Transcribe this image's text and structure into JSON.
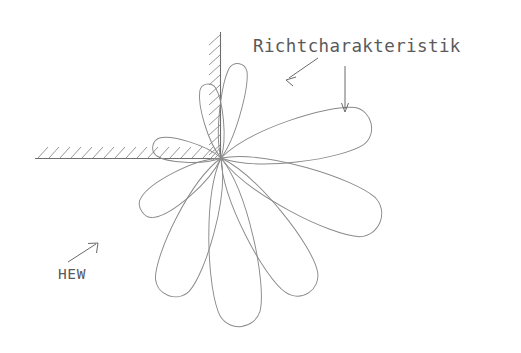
{
  "diagram": {
    "title_label": "Richtcharakteristik",
    "source_label": "HEW",
    "colors": {
      "lobe_stroke": "#8a8a8a",
      "wall_stroke": "#6e6e6e",
      "hatch_stroke": "#8a8a8a",
      "text": "#5a5a5a",
      "arrow": "#6a6a6a",
      "background": "#ffffff"
    },
    "origin": {
      "x": 221,
      "y": 158
    },
    "wall": {
      "name": "hatched-corner-wall",
      "horizontal": {
        "x1": 35,
        "y1": 158,
        "x2": 221,
        "y2": 158,
        "hatch_count": 17
      },
      "vertical": {
        "x1": 221,
        "y1": 32,
        "x2": 221,
        "y2": 158,
        "hatch_count": 12
      }
    },
    "annotations": [
      {
        "name": "arrow-to-upper-lobe",
        "type": "diagonal-arrow",
        "x1": 318,
        "y1": 58,
        "x2": 286,
        "y2": 80
      },
      {
        "name": "arrow-to-main-lobe",
        "type": "vertical-arrow",
        "x1": 345,
        "y1": 66,
        "x2": 345,
        "y2": 112
      },
      {
        "name": "hew-direction-arrow",
        "type": "diagonal-arrow",
        "x1": 68,
        "y1": 262,
        "x2": 98,
        "y2": 243
      }
    ],
    "lobes": [
      {
        "name": "lobe-up-near-vertical",
        "angle_deg": 101,
        "length": 74,
        "width": 17
      },
      {
        "name": "lobe-up-right-steep",
        "angle_deg": 79,
        "length": 97,
        "width": 19
      },
      {
        "name": "lobe-main-right",
        "angle_deg": 13,
        "length": 158,
        "width": 38
      },
      {
        "name": "lobe-lower-right-big",
        "angle_deg": -22,
        "length": 177,
        "width": 42
      },
      {
        "name": "lobe-lower-right-mid",
        "angle_deg": -57,
        "length": 166,
        "width": 38
      },
      {
        "name": "lobe-down-center",
        "angle_deg": -83,
        "length": 176,
        "width": 39
      },
      {
        "name": "lobe-down-left",
        "angle_deg": -111,
        "length": 152,
        "width": 36
      },
      {
        "name": "lobe-left-lower",
        "angle_deg": -146,
        "length": 98,
        "width": 26
      },
      {
        "name": "lobe-left-upper",
        "angle_deg": 170,
        "length": 71,
        "width": 19
      }
    ]
  }
}
